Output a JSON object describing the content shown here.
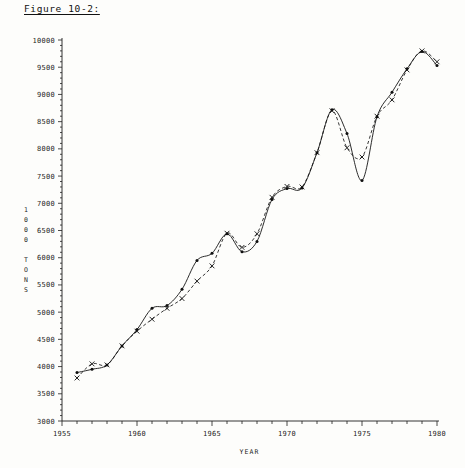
{
  "figure": {
    "title": "Figure 10-2:"
  },
  "chart_data": {
    "type": "line",
    "title": "Figure 10-2:",
    "xlabel": "YEAR",
    "ylabel": "1000 TONS",
    "ylabel_chars": [
      "1",
      "0",
      "0",
      "0",
      "",
      "T",
      "O",
      "N",
      "S"
    ],
    "xlim": [
      1955,
      1980
    ],
    "ylim": [
      3000,
      10000
    ],
    "ytick_step": 500,
    "xtick_major_step": 5,
    "xtick_minor_step": 1,
    "grid": false,
    "legend": "none",
    "ytick_labels": [
      "10000",
      "9500",
      "9000",
      "8500",
      "8000",
      "7500",
      "7000",
      "6500",
      "6000",
      "5500",
      "5000",
      "4500",
      "4000",
      "3500",
      "3000"
    ],
    "ytick_values": [
      10000,
      9500,
      9000,
      8500,
      8000,
      7500,
      7000,
      6500,
      6000,
      5500,
      5000,
      4500,
      4000,
      3500,
      3000
    ],
    "xtick_labels": [
      "1955",
      "1960",
      "1965",
      "1970",
      "1975",
      "1980"
    ],
    "xtick_values": [
      1955,
      1960,
      1965,
      1970,
      1975,
      1980
    ],
    "x": [
      1956,
      1957,
      1958,
      1959,
      1960,
      1961,
      1962,
      1963,
      1964,
      1965,
      1966,
      1967,
      1968,
      1969,
      1970,
      1971,
      1972,
      1973,
      1974,
      1975,
      1976,
      1977,
      1978,
      1979,
      1980
    ],
    "series": [
      {
        "name": "solid-observed",
        "marker": "dot",
        "linestyle": "solid",
        "values": [
          3890,
          3950,
          4030,
          4380,
          4680,
          5070,
          5120,
          5420,
          5950,
          6080,
          6440,
          6110,
          6300,
          7070,
          7270,
          7280,
          7930,
          8720,
          8280,
          7420,
          8590,
          9040,
          9470,
          9790,
          9530
        ]
      },
      {
        "name": "dashed-fitted",
        "marker": "x",
        "linestyle": "dashed",
        "values": [
          3790,
          4050,
          4030,
          4380,
          4650,
          4870,
          5070,
          5250,
          5570,
          5850,
          6450,
          6190,
          6440,
          7110,
          7310,
          7300,
          7930,
          8700,
          8020,
          7850,
          8600,
          8900,
          9450,
          9800,
          9600
        ]
      }
    ]
  }
}
